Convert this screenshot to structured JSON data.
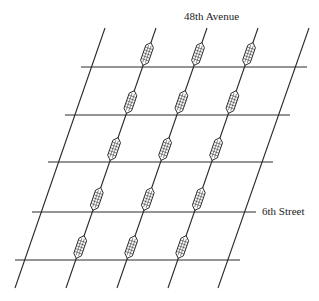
{
  "labels": {
    "avenue": "48th Avenue",
    "street": "6th Street"
  },
  "colors": {
    "line": "#2a2a2a",
    "marker_fill": "#ffffff",
    "background": "#ffffff"
  },
  "grid": {
    "diagonals": [
      {
        "top": [
          105,
          28
        ],
        "bottom": [
          15,
          288
        ]
      },
      {
        "top": [
          156,
          28
        ],
        "bottom": [
          66,
          288
        ]
      },
      {
        "top": [
          207,
          28
        ],
        "bottom": [
          117,
          288
        ]
      },
      {
        "top": [
          258,
          28
        ],
        "bottom": [
          168,
          288
        ]
      },
      {
        "top": [
          309,
          28
        ],
        "bottom": [
          218,
          288
        ]
      }
    ],
    "horizontals": [
      {
        "y": 67,
        "x1": 81,
        "x2": 307
      },
      {
        "y": 115,
        "x1": 65,
        "x2": 290
      },
      {
        "y": 162,
        "x1": 48,
        "x2": 273
      },
      {
        "y": 212,
        "x1": 32,
        "x2": 256
      },
      {
        "y": 260,
        "x1": 15,
        "x2": 240
      }
    ],
    "marker_diagonals": [
      1,
      2,
      3
    ],
    "marker_count": 15
  }
}
